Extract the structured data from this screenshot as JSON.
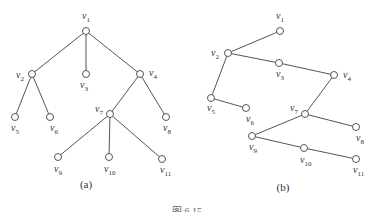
{
  "diagrams": [
    {
      "id": "a",
      "caption": "(a)",
      "caption_pos": [
        86,
        188
      ],
      "nodes": [
        {
          "id": "v1",
          "label": "v",
          "sub": "1",
          "x": 86,
          "y": 31,
          "lx": 82,
          "ly": 19
        },
        {
          "id": "v2",
          "label": "v",
          "sub": "2",
          "x": 32,
          "y": 74,
          "lx": 16,
          "ly": 78
        },
        {
          "id": "v3",
          "label": "v",
          "sub": "3",
          "x": 86,
          "y": 74,
          "lx": 80,
          "ly": 88
        },
        {
          "id": "v4",
          "label": "v",
          "sub": "4",
          "x": 140,
          "y": 74,
          "lx": 149,
          "ly": 76
        },
        {
          "id": "v5",
          "label": "v",
          "sub": "5",
          "x": 15,
          "y": 117,
          "lx": 11,
          "ly": 131
        },
        {
          "id": "v6",
          "label": "v",
          "sub": "6",
          "x": 50,
          "y": 117,
          "lx": 50,
          "ly": 131
        },
        {
          "id": "v7",
          "label": "v",
          "sub": "7",
          "x": 110,
          "y": 114,
          "lx": 95,
          "ly": 112
        },
        {
          "id": "v8",
          "label": "v",
          "sub": "8",
          "x": 166,
          "y": 117,
          "lx": 163,
          "ly": 131
        },
        {
          "id": "v9",
          "label": "v",
          "sub": "9",
          "x": 58,
          "y": 157,
          "lx": 54,
          "ly": 172
        },
        {
          "id": "v10",
          "label": "v",
          "sub": "10",
          "x": 109,
          "y": 157,
          "lx": 104,
          "ly": 172
        },
        {
          "id": "v11",
          "label": "v",
          "sub": "11",
          "x": 162,
          "y": 159,
          "lx": 160,
          "ly": 173
        }
      ],
      "edges": [
        [
          "v1",
          "v2"
        ],
        [
          "v1",
          "v3"
        ],
        [
          "v1",
          "v4"
        ],
        [
          "v2",
          "v5"
        ],
        [
          "v2",
          "v6"
        ],
        [
          "v4",
          "v7"
        ],
        [
          "v4",
          "v8"
        ],
        [
          "v7",
          "v9"
        ],
        [
          "v7",
          "v10"
        ],
        [
          "v7",
          "v11"
        ]
      ]
    },
    {
      "id": "b",
      "caption": "(b)",
      "caption_pos": [
        283,
        191
      ],
      "nodes": [
        {
          "id": "v1",
          "label": "v",
          "sub": "1",
          "x": 280,
          "y": 31,
          "lx": 276,
          "ly": 19
        },
        {
          "id": "v2",
          "label": "v",
          "sub": "2",
          "x": 228,
          "y": 53,
          "lx": 211,
          "ly": 56
        },
        {
          "id": "v3",
          "label": "v",
          "sub": "3",
          "x": 279,
          "y": 63,
          "lx": 276,
          "ly": 77
        },
        {
          "id": "v4",
          "label": "v",
          "sub": "4",
          "x": 334,
          "y": 75,
          "lx": 343,
          "ly": 78
        },
        {
          "id": "v5",
          "label": "v",
          "sub": "5",
          "x": 211,
          "y": 98,
          "lx": 207,
          "ly": 111
        },
        {
          "id": "v6",
          "label": "v",
          "sub": "6",
          "x": 246,
          "y": 108,
          "lx": 246,
          "ly": 122
        },
        {
          "id": "v7",
          "label": "v",
          "sub": "7",
          "x": 305,
          "y": 114,
          "lx": 290,
          "ly": 111
        },
        {
          "id": "v8",
          "label": "v",
          "sub": "8",
          "x": 356,
          "y": 127,
          "lx": 356,
          "ly": 141
        },
        {
          "id": "v9",
          "label": "v",
          "sub": "9",
          "x": 252,
          "y": 136,
          "lx": 249,
          "ly": 150
        },
        {
          "id": "v10",
          "label": "v",
          "sub": "10",
          "x": 304,
          "y": 148,
          "lx": 300,
          "ly": 163
        },
        {
          "id": "v11",
          "label": "v",
          "sub": "11",
          "x": 356,
          "y": 159,
          "lx": 353,
          "ly": 173
        }
      ],
      "edges": [
        [
          "v1",
          "v2"
        ],
        [
          "v2",
          "v3"
        ],
        [
          "v3",
          "v4"
        ],
        [
          "v2",
          "v5"
        ],
        [
          "v5",
          "v6"
        ],
        [
          "v4",
          "v7"
        ],
        [
          "v7",
          "v8"
        ],
        [
          "v7",
          "v9"
        ],
        [
          "v9",
          "v10"
        ],
        [
          "v10",
          "v11"
        ]
      ]
    }
  ],
  "figure_caption": "图 6.15",
  "colors": {
    "stroke": "#555555",
    "node_fill": "#ffffff",
    "text": "#333333"
  }
}
